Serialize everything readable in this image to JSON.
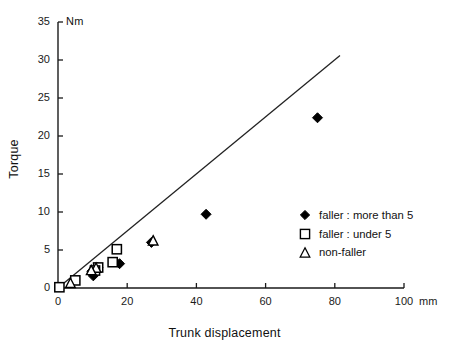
{
  "chart_data": {
    "type": "scatter",
    "title": "",
    "subtitle": "",
    "xlabel": "Trunk displacement",
    "ylabel": "Torque",
    "x_unit": "mm",
    "y_unit": "Nm",
    "xlim": [
      0,
      100
    ],
    "ylim": [
      0,
      35
    ],
    "xticks": [
      0,
      20,
      40,
      60,
      80,
      100
    ],
    "xtick_labels": [
      "0",
      "20",
      "40",
      "60",
      "80",
      "100"
    ],
    "yticks": [
      0,
      5,
      10,
      15,
      20,
      25,
      30,
      35
    ],
    "ytick_labels": [
      "0",
      "5",
      "10",
      "15",
      "20",
      "25",
      "30",
      "35"
    ],
    "grid": false,
    "legend_position": "lower-right",
    "series": [
      {
        "name": "faller : more than 5",
        "marker": "filled-diamond",
        "color": "#000000",
        "points": [
          {
            "x": 75.0,
            "y": 22.4
          },
          {
            "x": 42.8,
            "y": 9.7
          },
          {
            "x": 27.0,
            "y": 6.0
          },
          {
            "x": 17.8,
            "y": 3.2
          },
          {
            "x": 11.5,
            "y": 2.7
          },
          {
            "x": 10.2,
            "y": 1.6
          },
          {
            "x": 9.8,
            "y": 2.2
          }
        ]
      },
      {
        "name": "faller : under 5",
        "marker": "open-square",
        "color": "#000000",
        "points": [
          {
            "x": 17.0,
            "y": 5.1
          },
          {
            "x": 15.8,
            "y": 3.4
          },
          {
            "x": 11.6,
            "y": 2.7
          },
          {
            "x": 10.7,
            "y": 2.3
          },
          {
            "x": 5.0,
            "y": 1.0
          },
          {
            "x": 0.4,
            "y": 0.1
          }
        ]
      },
      {
        "name": "non-faller",
        "marker": "open-triangle",
        "color": "#000000",
        "points": [
          {
            "x": 27.5,
            "y": 6.2
          },
          {
            "x": 11.0,
            "y": 2.6
          },
          {
            "x": 9.6,
            "y": 2.3
          },
          {
            "x": 3.6,
            "y": 0.6
          }
        ]
      }
    ],
    "trendline": {
      "name": "reference line",
      "x0": 0,
      "y0": 0,
      "x1": 81.5,
      "y1": 30.6,
      "color": "#222222"
    }
  },
  "axes": {
    "y_unit_label": "Nm",
    "x_unit_label": "mm",
    "x_title": "Trunk displacement",
    "y_title": "Torque"
  },
  "legend": {
    "entries": [
      {
        "label": "faller : more than 5",
        "marker": "filled-diamond-icon"
      },
      {
        "label": "faller : under 5",
        "marker": "open-square-icon"
      },
      {
        "label": "non-faller",
        "marker": "open-triangle-icon"
      }
    ]
  }
}
